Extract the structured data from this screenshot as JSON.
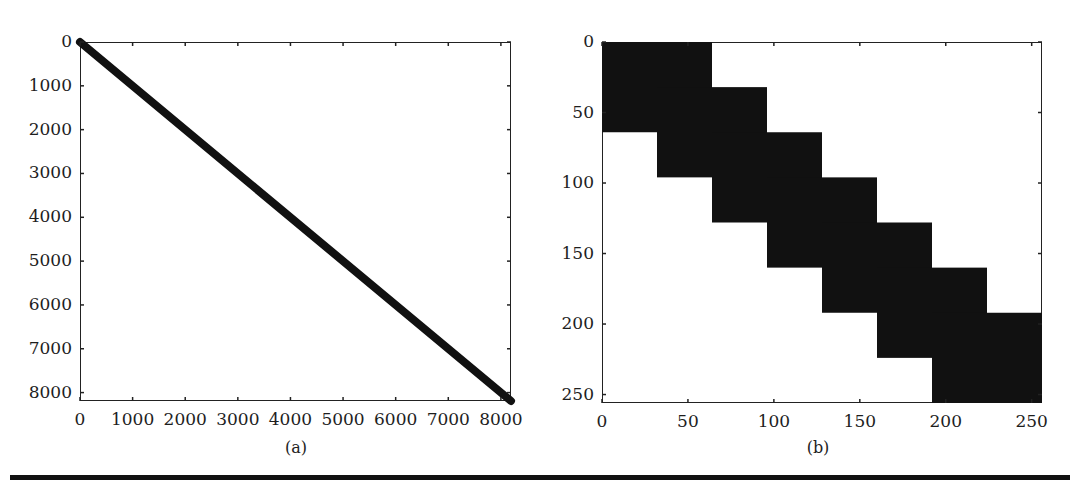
{
  "chart_data": [
    {
      "panel": "a",
      "type": "heatmap",
      "subtype": "sparsity-pattern",
      "title": "",
      "caption": "(a)",
      "xlabel": "",
      "ylabel": "",
      "xlim": [
        0,
        8192
      ],
      "ylim": [
        8192,
        0
      ],
      "x_ticks": [
        0,
        1000,
        2000,
        3000,
        4000,
        5000,
        6000,
        7000,
        8000
      ],
      "y_ticks": [
        0,
        1000,
        2000,
        3000,
        4000,
        5000,
        6000,
        7000,
        8000
      ],
      "x_tick_labels": [
        "0",
        "1000",
        "2000",
        "3000",
        "4000",
        "5000",
        "6000",
        "7000",
        "8000"
      ],
      "y_tick_labels": [
        "0",
        "1000",
        "2000",
        "3000",
        "4000",
        "5000",
        "6000",
        "7000",
        "8000"
      ],
      "description": "Banded diagonal nonzero pattern from (0,0) to (8192,8192)",
      "diagonal_band": {
        "start": [
          0,
          0
        ],
        "end": [
          8192,
          8192
        ]
      },
      "grid": false
    },
    {
      "panel": "b",
      "type": "heatmap",
      "subtype": "sparsity-pattern",
      "title": "",
      "caption": "(b)",
      "xlabel": "",
      "ylabel": "",
      "xlim": [
        0,
        256
      ],
      "ylim": [
        256,
        0
      ],
      "x_ticks": [
        0,
        50,
        100,
        150,
        200,
        250
      ],
      "y_ticks": [
        0,
        50,
        100,
        150,
        200,
        250
      ],
      "x_tick_labels": [
        "0",
        "50",
        "100",
        "150",
        "200",
        "250"
      ],
      "y_tick_labels": [
        "0",
        "50",
        "100",
        "150",
        "200",
        "250"
      ],
      "description": "Overlapping 64x64 dense blocks along the diagonal, offset by 32",
      "blocks": [
        {
          "x0": 0,
          "y0": 0,
          "size": 64
        },
        {
          "x0": 32,
          "y0": 32,
          "size": 64
        },
        {
          "x0": 64,
          "y0": 64,
          "size": 64
        },
        {
          "x0": 96,
          "y0": 96,
          "size": 64
        },
        {
          "x0": 128,
          "y0": 128,
          "size": 64
        },
        {
          "x0": 160,
          "y0": 160,
          "size": 64
        },
        {
          "x0": 192,
          "y0": 192,
          "size": 64
        }
      ],
      "grid": false
    }
  ],
  "colors": {
    "fill": "#111111",
    "background": "#ffffff",
    "axis": "#222222"
  }
}
